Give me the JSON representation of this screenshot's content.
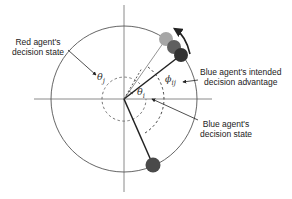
{
  "diagram": {
    "type": "polar decision-state diagram",
    "labels": {
      "red_state_line1": "Red agent's",
      "red_state_line2": "decision state",
      "blue_intended_line1": "Blue agent's intended",
      "blue_intended_line2": "decision advantage",
      "blue_state_line1": "Blue agent's",
      "blue_state_line2": "decision state"
    },
    "symbols": {
      "theta_j": "θ",
      "theta_j_sub": "j",
      "theta_i": "θ",
      "theta_i_sub": "i",
      "phi_ij": "ϕ",
      "phi_ij_sub": "ij"
    },
    "colors": {
      "axis": "#888888",
      "circle": "#555555",
      "dashed": "#666666",
      "light_agent": "#a6a6a6",
      "mid_agent": "#5f5f5f",
      "dark_agent": "#333333",
      "bottom_agent": "#4a4a4a",
      "arrow": "#333333"
    }
  }
}
